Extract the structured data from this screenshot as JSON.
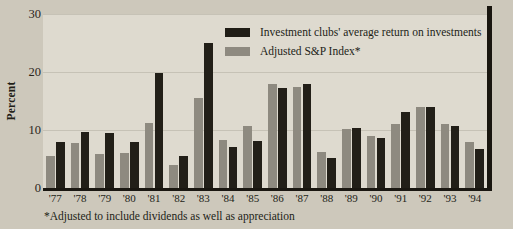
{
  "chart_data": {
    "type": "bar",
    "title": "",
    "xlabel": "",
    "ylabel": "Percent",
    "ylim": [
      0,
      30
    ],
    "yticks": [
      0,
      10,
      20,
      30
    ],
    "grid": true,
    "legend_position": "top-right",
    "categories": [
      "'77",
      "'78",
      "'79",
      "'80",
      "'81",
      "'82",
      "'83",
      "'84",
      "'85",
      "'86",
      "'87",
      "'88",
      "'89",
      "'90",
      "'91",
      "'92",
      "'93",
      "'94"
    ],
    "series": [
      {
        "name": "Investment clubs' average return on investments",
        "color": "#201d16",
        "values": [
          8.0,
          9.6,
          9.4,
          7.9,
          19.8,
          5.6,
          25.0,
          7.0,
          8.1,
          17.2,
          18.0,
          5.2,
          10.3,
          8.6,
          13.1,
          14.0,
          10.7,
          6.8
        ]
      },
      {
        "name": "Adjusted S&P Index*",
        "color": "#8e8a80",
        "values": [
          5.5,
          7.8,
          5.9,
          6.1,
          11.2,
          4.0,
          15.6,
          8.2,
          10.7,
          17.9,
          17.4,
          6.2,
          10.2,
          8.9,
          11.0,
          13.9,
          11.1,
          7.9
        ]
      }
    ],
    "footnote": "*Adjusted to include dividends as well as appreciation"
  },
  "legend": {
    "items": [
      {
        "label": "Investment clubs' average return on investments"
      },
      {
        "label": "Adjusted S&P Index*"
      }
    ]
  }
}
